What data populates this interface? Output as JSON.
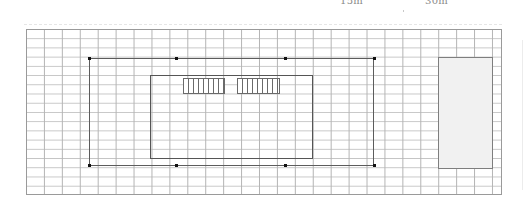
{
  "scale": {
    "labels": [
      {
        "text": "15m",
        "x": 340
      },
      {
        "text": "30m",
        "x": 425
      }
    ]
  },
  "canvas": {
    "grid": {
      "columns": 26.5,
      "rows": 18,
      "cell_w": 17.93,
      "cell_h": 9.22
    },
    "outer_frame": {
      "handles_x": [
        89,
        176,
        285,
        374
      ],
      "top_y": 58,
      "bottom_y": 166
    },
    "inner_frame": {
      "x": 150,
      "y": 75,
      "w": 163,
      "h": 84
    },
    "hatch_blocks": [
      {
        "x": 183,
        "w": 42
      },
      {
        "x": 237,
        "w": 43
      }
    ],
    "side_panel": {
      "x": 438,
      "y": 57,
      "w": 55,
      "h": 112,
      "fill": "#f1f1f1"
    }
  },
  "colors": {
    "grid_line": "#b4b4b4",
    "frame": "#5c5c5c",
    "handle": "#111111"
  }
}
